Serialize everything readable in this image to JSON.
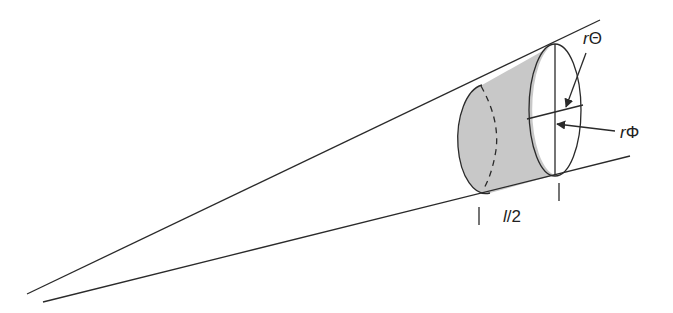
{
  "diagram": {
    "title": "",
    "labels": {
      "r_theta": {
        "r": "r",
        "sym": "Θ"
      },
      "r_phi": {
        "r": "r",
        "sym": "Φ"
      },
      "half_length": {
        "l": "l",
        "rest": "/2"
      }
    },
    "colors": {
      "stroke": "#2a2a2a",
      "shaded": "#c8c8c8",
      "background": "#ffffff"
    }
  }
}
